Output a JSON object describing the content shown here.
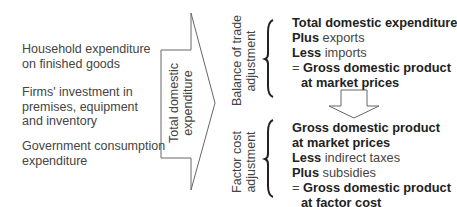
{
  "inputs": {
    "items": [
      {
        "lines": [
          "Household expenditure",
          "on finished goods"
        ]
      },
      {
        "lines": [
          "Firms' investment in",
          "premises, equipment",
          "and inventory"
        ]
      },
      {
        "lines": [
          "Government consumption",
          "expenditure"
        ]
      }
    ]
  },
  "main_arrow": {
    "label_lines": [
      "Total domestic",
      "expenditure"
    ]
  },
  "stage1": {
    "label_lines": [
      "Balance of trade",
      "adjustment"
    ],
    "lines": [
      {
        "bold": "Total domestic expenditure",
        "normal": ""
      },
      {
        "bold": "Plus",
        "normal": " exports"
      },
      {
        "bold": "Less",
        "normal": " imports"
      },
      {
        "prefix": "= ",
        "bold": "Gross domestic product",
        "normal": ""
      },
      {
        "bold": "at market prices",
        "normal": "",
        "indent": true
      }
    ]
  },
  "stage2": {
    "label_lines": [
      "Factor cost",
      "adjustment"
    ],
    "lines": [
      {
        "bold": "Gross domestic product",
        "normal": ""
      },
      {
        "bold": "at market prices",
        "normal": ""
      },
      {
        "bold": "Less",
        "normal": " indirect taxes"
      },
      {
        "bold": "Plus",
        "normal": " subsidies"
      },
      {
        "prefix": "= ",
        "bold": "Gross domestic product",
        "normal": ""
      },
      {
        "bold": "at factor cost",
        "normal": "",
        "indent": true
      }
    ]
  },
  "colors": {
    "stroke": "#555555",
    "text": "#444444",
    "bold_text": "#222222"
  }
}
